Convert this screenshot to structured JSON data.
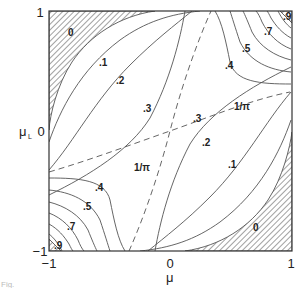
{
  "chart_data": {
    "type": "contour",
    "title": "",
    "xlabel": "μ",
    "ylabel": "μ",
    "ylabel_subscript": "L",
    "xlim": [
      -1,
      1
    ],
    "ylim": [
      -1,
      1
    ],
    "x_ticks": [
      "−1",
      "0",
      "1"
    ],
    "y_ticks": [
      "−1",
      "0",
      "1"
    ],
    "symmetry": "point-symmetric about (0,0)",
    "hatched_regions": [
      {
        "name": "upper-left",
        "level_label": "0"
      },
      {
        "name": "lower-right",
        "level_label": "0"
      }
    ],
    "contour_levels": [
      0,
      0.1,
      0.2,
      0.3,
      0.4,
      0.5,
      0.6,
      0.7,
      0.8,
      0.9
    ],
    "contour_labels": [
      {
        "text": "0",
        "region": "upper-left"
      },
      {
        "text": ".1",
        "region": "upper-left"
      },
      {
        "text": ".2",
        "region": "upper-left"
      },
      {
        "text": ".3",
        "region": "upper-left"
      },
      {
        "text": ".4",
        "region": "upper-right"
      },
      {
        "text": ".5",
        "region": "upper-right"
      },
      {
        "text": ".7",
        "region": "upper-right"
      },
      {
        "text": ".9",
        "region": "upper-right"
      },
      {
        "text": ".3",
        "region": "lower-right"
      },
      {
        "text": ".2",
        "region": "lower-right"
      },
      {
        "text": ".1",
        "region": "lower-right"
      },
      {
        "text": "0",
        "region": "lower-right"
      },
      {
        "text": ".4",
        "region": "lower-left"
      },
      {
        "text": ".5",
        "region": "lower-left"
      },
      {
        "text": ".7",
        "region": "lower-left"
      },
      {
        "text": ".9",
        "region": "lower-left"
      }
    ],
    "dashed_lines": [
      {
        "label": "1/π",
        "description": "shallow dashed curve through origin"
      },
      {
        "label": "1/π",
        "description": "steep dashed curve through origin"
      }
    ],
    "grid": false,
    "legend": "none"
  },
  "caption": "Fig."
}
